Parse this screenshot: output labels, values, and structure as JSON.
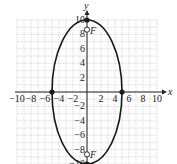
{
  "diagram": {
    "type": "ellipse-graph",
    "axes": {
      "x_label": "x",
      "y_label": "y",
      "x_ticks": [
        "-10",
        "-8",
        "-6",
        "-4",
        "-2",
        "2",
        "4",
        "6",
        "8",
        "10"
      ],
      "y_ticks": [
        "10",
        "8",
        "6",
        "4",
        "2",
        "-2",
        "-4",
        "-6",
        "-8",
        "-10"
      ],
      "xlim": [
        -10,
        10
      ],
      "ylim": [
        -10,
        10
      ]
    },
    "ellipse": {
      "center": [
        0,
        0
      ],
      "semi_major": 10,
      "semi_minor": 5,
      "orientation": "vertical"
    },
    "vertices": [
      [
        0,
        10
      ],
      [
        0,
        -10
      ],
      [
        -5,
        0
      ],
      [
        5,
        0
      ]
    ],
    "foci": [
      {
        "label": "F",
        "point": [
          0,
          8.66
        ]
      },
      {
        "label": "F",
        "point": [
          0,
          -8.66
        ]
      }
    ],
    "colors": {
      "curve": "#1a1a1a",
      "grid": "#bbbbbb",
      "axis": "#222222"
    }
  }
}
